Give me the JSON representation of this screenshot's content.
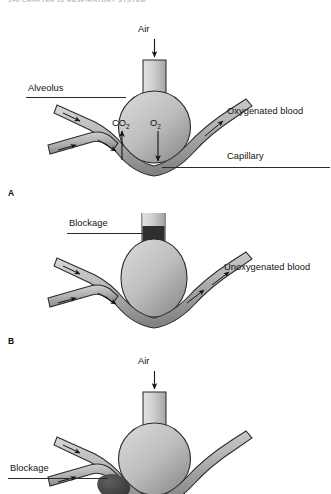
{
  "page": {
    "running_head": "146  CHAPTER 12   RESPIRATORY SYSTEM",
    "background_color": "#ffffff",
    "ink_color": "#111111"
  },
  "figure": {
    "panel_count": 3
  },
  "palette": {
    "alveolus_fill_light": "#d6d6d6",
    "alveolus_fill_dark": "#8f8f8f",
    "vessel_fill_light": "#d2d2d2",
    "vessel_fill_dark": "#8a8a8a",
    "blockage_dark": "#3a3a3a",
    "blockage_mid": "#5a5a5a",
    "outline": "#2b2b2b",
    "leader_line": "#2b2b2b"
  },
  "panels": [
    {
      "id": "A",
      "letter": "A",
      "caption_state": "normal gas exchange",
      "labels": [
        {
          "name": "air",
          "text": "Air",
          "leader": false
        },
        {
          "name": "alveolus",
          "text": "Alveolus",
          "leader": true
        },
        {
          "name": "capillary",
          "text": "Capillary",
          "leader": true
        },
        {
          "name": "oxygenated-blood",
          "text": "Oxygenated blood",
          "leader": false
        },
        {
          "name": "carbon-dioxide",
          "text": "CO",
          "subscript": "2",
          "leader": false
        },
        {
          "name": "oxygen",
          "text": "O",
          "subscript": "2",
          "leader": false
        }
      ],
      "flow_arrows": {
        "air_direction": "down",
        "co2_direction": "up",
        "o2_direction": "down",
        "blood_direction": "left-to-right"
      }
    },
    {
      "id": "B",
      "letter": "B",
      "caption_state": "airway blocked",
      "labels": [
        {
          "name": "blockage",
          "text": "Blockage",
          "leader": true
        },
        {
          "name": "unoxygenated-blood",
          "text": "Unoxygenated blood",
          "leader": false
        }
      ],
      "flow_arrows": {
        "air_direction": "none",
        "blood_direction": "left-to-right"
      }
    },
    {
      "id": "C",
      "letter": "C",
      "caption_state": "capillary blocked",
      "labels": [
        {
          "name": "air",
          "text": "Air",
          "leader": false
        },
        {
          "name": "blockage",
          "text": "Blockage",
          "leader": true
        }
      ],
      "flow_arrows": {
        "air_direction": "down",
        "blood_direction": "left-to-right"
      }
    }
  ]
}
